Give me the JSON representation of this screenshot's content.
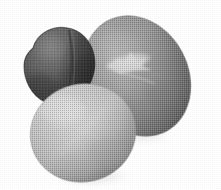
{
  "scene": {
    "title": "Three pebbles",
    "description": "Photograph of three smooth grayscale stones arranged on a plain white background, reproduced with a coarse halftone print texture.",
    "width": 221,
    "height": 190,
    "background_color": "#ffffff",
    "render_style": "halftone-dither",
    "object_count": 3
  },
  "objects": [
    {
      "id": "stone-dark",
      "label": "Dark stone",
      "position": "upper-left",
      "shape": "rounded triangular wedge",
      "center": {
        "x": 60,
        "y": 66
      },
      "size": {
        "width": 76,
        "height": 80
      },
      "rotation_deg": -8,
      "colors": {
        "base": "#5d5d5d",
        "highlight": "#8e8e8e",
        "shadow": "#343434",
        "edge": "#2c2c2c"
      },
      "features": [
        "vertical crease on right flank",
        "matte surface",
        "darkest of the three"
      ],
      "z_order": 1
    },
    {
      "id": "stone-large-gray",
      "label": "Large gray stone",
      "position": "right",
      "shape": "oval",
      "center": {
        "x": 137,
        "y": 76
      },
      "size": {
        "width": 102,
        "height": 125
      },
      "rotation_deg": -28,
      "colors": {
        "base": "#9d9d9d",
        "highlight": "#c4c4c4",
        "shadow": "#6e6e6e",
        "edge": "#5f5f5f",
        "vein": "#d8d8d8"
      },
      "features": [
        "light branching quartz vein across upper middle",
        "largest of the three",
        "smooth ovoid"
      ],
      "z_order": 2
    },
    {
      "id": "stone-light",
      "label": "Light stone",
      "position": "bottom-left",
      "shape": "round oval",
      "center": {
        "x": 83,
        "y": 133
      },
      "size": {
        "width": 106,
        "height": 98
      },
      "rotation_deg": -14,
      "colors": {
        "base": "#cdcdcd",
        "highlight": "#e6e6e6",
        "shadow": "#9b9b9b",
        "edge": "#8d8d8d"
      },
      "features": [
        "lightest of the three",
        "overlaps the large gray stone in front",
        "soft cast shadow below right"
      ],
      "z_order": 3
    }
  ],
  "shadows": [
    {
      "id": "shadow-light-stone",
      "belongs_to": "stone-light",
      "center": {
        "x": 92,
        "y": 176
      },
      "size": {
        "width": 92,
        "height": 22
      },
      "color": "#b9b9b9",
      "opacity": 0.55
    },
    {
      "id": "shadow-large-stone",
      "belongs_to": "stone-large-gray",
      "center": {
        "x": 143,
        "y": 136
      },
      "size": {
        "width": 72,
        "height": 16
      },
      "color": "#c6c6c6",
      "opacity": 0.45
    }
  ],
  "palette": {
    "background": "#ffffff",
    "dark_stone": "#5d5d5d",
    "gray_stone": "#9d9d9d",
    "light_stone": "#cdcdcd",
    "vein": "#d8d8d8"
  }
}
